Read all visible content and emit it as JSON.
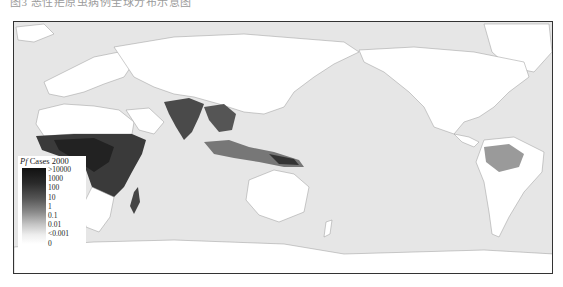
{
  "caption": "图3 恶性疟原虫病例全球分布示意图",
  "map": {
    "title_species": "Pf",
    "title_rest": " Cases 2000",
    "legend": {
      "labels": [
        ">10000",
        "1000",
        "100",
        "10",
        "1",
        "0.1",
        "0.01",
        "<0.001",
        "0"
      ],
      "scale": "grayscale, dark = high"
    },
    "colors": {
      "ocean": "#e6e6e6",
      "land_no_risk": "#ffffff",
      "high_cases": "#1a1a1a",
      "frame": "#333333"
    },
    "regions_with_cases": [
      "Sub-Saharan Africa",
      "Madagascar",
      "South Asia",
      "Southeast Asia",
      "Indonesia / Papua New Guinea",
      "Amazon basin"
    ]
  }
}
